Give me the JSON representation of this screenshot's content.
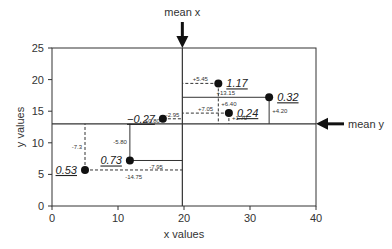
{
  "chart_data": {
    "type": "scatter",
    "title": "",
    "xlabel": "x values",
    "ylabel": "y values",
    "xlim": [
      0,
      40
    ],
    "ylim": [
      0,
      25
    ],
    "xticks": [
      0,
      10,
      20,
      30,
      40
    ],
    "yticks": [
      0,
      5,
      10,
      15,
      20,
      25
    ],
    "grid": false,
    "mean_x": 19.75,
    "mean_y": 13.0,
    "annotations": {
      "mean_x_label": "mean x",
      "mean_y_label": "mean y"
    },
    "points": [
      {
        "x": 5.0,
        "y": 5.7,
        "label": "0.53",
        "dx": "-14.75",
        "dy": "-7.3"
      },
      {
        "x": 11.8,
        "y": 7.2,
        "label": "0.73",
        "dx": "-7.95",
        "dy": "-5.80"
      },
      {
        "x": 16.8,
        "y": 13.8,
        "label": "−0.27",
        "dx": "-2.95",
        "dy": "+0.80"
      },
      {
        "x": 25.2,
        "y": 19.4,
        "label": "1.17",
        "dx": "+5.45",
        "dy": "+6.40"
      },
      {
        "x": 26.8,
        "y": 14.7,
        "label": "0.24",
        "dx": "+7.05",
        "dy": "+1.70"
      },
      {
        "x": 32.9,
        "y": 17.2,
        "label": "0.32",
        "dx": "+13.15",
        "dy": "+4.20"
      }
    ]
  }
}
